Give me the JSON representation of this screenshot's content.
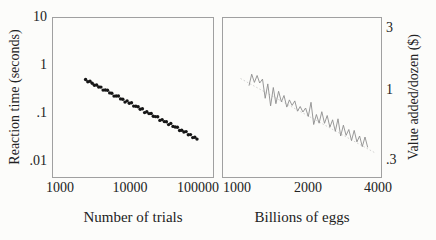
{
  "figure": {
    "background": "#fcfcfa",
    "frame_color": "#a0a0a0",
    "text_color": "#222222"
  },
  "chart_data": [
    {
      "type": "scatter",
      "title": "",
      "xlabel": "Number of trials",
      "ylabel": "Reaction time (seconds)",
      "xscale": "log",
      "yscale": "log",
      "grid": false,
      "xlim": [
        760,
        165000
      ],
      "ylim": [
        0.0046,
        10
      ],
      "xticks": [
        {
          "value": 1000,
          "label": "1000"
        },
        {
          "value": 10000,
          "label": "10000"
        },
        {
          "value": 100000,
          "label": "100000"
        }
      ],
      "yticks": [
        {
          "value": 10,
          "label": "10"
        },
        {
          "value": 1,
          "label": "1"
        },
        {
          "value": 0.1,
          "label": ".1"
        },
        {
          "value": 0.01,
          "label": ".01"
        }
      ],
      "marker_color": "#161616",
      "marker_radius": 1.7,
      "points": [
        [
          2300,
          0.51
        ],
        [
          2474,
          0.459
        ],
        [
          2662,
          0.47
        ],
        [
          2863,
          0.424
        ],
        [
          3080,
          0.385
        ],
        [
          3313,
          0.39
        ],
        [
          3564,
          0.355
        ],
        [
          3834,
          0.354
        ],
        [
          4125,
          0.306
        ],
        [
          4437,
          0.307
        ],
        [
          4773,
          0.305
        ],
        [
          5134,
          0.267
        ],
        [
          5523,
          0.263
        ],
        [
          5941,
          0.229
        ],
        [
          6391,
          0.231
        ],
        [
          6875,
          0.23
        ],
        [
          7395,
          0.201
        ],
        [
          7955,
          0.198
        ],
        [
          8558,
          0.172
        ],
        [
          9206,
          0.182
        ],
        [
          9903,
          0.163
        ],
        [
          10653,
          0.166
        ],
        [
          11459,
          0.142
        ],
        [
          12327,
          0.141
        ],
        [
          13260,
          0.137
        ],
        [
          14264,
          0.122
        ],
        [
          15344,
          0.125
        ],
        [
          16506,
          0.104
        ],
        [
          17756,
          0.108
        ],
        [
          19100,
          0.099
        ],
        [
          20546,
          0.0995
        ],
        [
          22102,
          0.0869
        ],
        [
          23775,
          0.0857
        ],
        [
          25575,
          0.0852
        ],
        [
          27512,
          0.0713
        ],
        [
          29595,
          0.0741
        ],
        [
          31835,
          0.0673
        ],
        [
          34246,
          0.067
        ],
        [
          36839,
          0.0584
        ],
        [
          39628,
          0.0617
        ],
        [
          42628,
          0.0535
        ],
        [
          45856,
          0.0521
        ],
        [
          49328,
          0.0513
        ],
        [
          53063,
          0.0439
        ],
        [
          57080,
          0.0446
        ],
        [
          61402,
          0.041
        ],
        [
          66051,
          0.0416
        ],
        [
          71052,
          0.0359
        ],
        [
          76432,
          0.0361
        ],
        [
          82219,
          0.0312
        ],
        [
          88444,
          0.0317
        ],
        [
          95141,
          0.0291
        ]
      ]
    },
    {
      "type": "line",
      "title": "",
      "xlabel": "Billions of eggs",
      "ylabel": "Value added/dozen ($)",
      "xscale": "log",
      "yscale": "log",
      "grid": false,
      "xlim": [
        863,
        4125
      ],
      "ylim": [
        0.2186,
        3.57
      ],
      "xticks": [
        {
          "value": 1000,
          "label": "1000"
        },
        {
          "value": 2000,
          "label": "2000"
        },
        {
          "value": 4000,
          "label": "4000"
        }
      ],
      "yticks": [
        {
          "value": 3,
          "label": "3"
        },
        {
          "value": 1,
          "label": "1"
        },
        {
          "value": 0.3,
          "label": ".3"
        }
      ],
      "line_color": "#8d8d8d",
      "trend_line": {
        "style": "dashed",
        "color": "#c8c8c6",
        "points": [
          [
            1030,
            1.23
          ],
          [
            3880,
            0.335
          ]
        ]
      },
      "points": [
        [
          1120,
          1.086
        ],
        [
          1150,
          1.326
        ],
        [
          1181,
          1.149
        ],
        [
          1213,
          1.298
        ],
        [
          1245,
          1.138
        ],
        [
          1279,
          1.217
        ],
        [
          1313,
          0.871
        ],
        [
          1348,
          1.121
        ],
        [
          1385,
          0.763
        ],
        [
          1422,
          1.051
        ],
        [
          1460,
          0.793
        ],
        [
          1499,
          0.984
        ],
        [
          1540,
          0.819
        ],
        [
          1581,
          0.914
        ],
        [
          1624,
          0.747
        ],
        [
          1667,
          0.847
        ],
        [
          1712,
          0.77
        ],
        [
          1758,
          0.832
        ],
        [
          1805,
          0.696
        ],
        [
          1854,
          0.755
        ],
        [
          1904,
          0.686
        ],
        [
          1955,
          0.735
        ],
        [
          2008,
          0.634
        ],
        [
          2062,
          0.812
        ],
        [
          2117,
          0.551
        ],
        [
          2174,
          0.656
        ],
        [
          2233,
          0.564
        ],
        [
          2293,
          0.689
        ],
        [
          2354,
          0.563
        ],
        [
          2418,
          0.645
        ],
        [
          2483,
          0.526
        ],
        [
          2550,
          0.599
        ],
        [
          2618,
          0.49
        ],
        [
          2689,
          0.609
        ],
        [
          2761,
          0.451
        ],
        [
          2836,
          0.545
        ],
        [
          2912,
          0.456
        ],
        [
          2990,
          0.505
        ],
        [
          3071,
          0.416
        ],
        [
          3153,
          0.497
        ],
        [
          3238,
          0.407
        ],
        [
          3325,
          0.451
        ],
        [
          3415,
          0.375
        ],
        [
          3507,
          0.443
        ],
        [
          3601,
          0.37
        ]
      ]
    }
  ]
}
